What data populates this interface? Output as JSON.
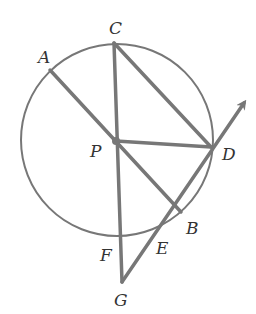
{
  "diagram": {
    "type": "circle-geometry",
    "stroke_color": "#777777",
    "label_color": "#333333",
    "circle": {
      "center": "P",
      "cx": 117,
      "cy": 140,
      "r": 96
    },
    "points": {
      "A": {
        "label": "A",
        "x": 50,
        "y": 70,
        "lx": 38,
        "ly": 63
      },
      "C": {
        "label": "C",
        "x": 114,
        "y": 43,
        "lx": 109,
        "ly": 34
      },
      "P": {
        "label": "P",
        "x": 116,
        "y": 141,
        "lx": 90,
        "ly": 157
      },
      "D": {
        "label": "D",
        "x": 211,
        "y": 147,
        "lx": 222,
        "ly": 160
      },
      "B": {
        "label": "B",
        "x": 181,
        "y": 212,
        "lx": 186,
        "ly": 234
      },
      "E": {
        "label": "E",
        "x": 156,
        "y": 233,
        "lx": 156,
        "ly": 254
      },
      "F": {
        "label": "F",
        "x": 119,
        "y": 238,
        "lx": 100,
        "ly": 261
      },
      "G": {
        "label": "G",
        "x": 122,
        "y": 282,
        "lx": 114,
        "ly": 306
      }
    },
    "segments": [
      {
        "name": "segment-AB",
        "from": "A",
        "to": "B"
      },
      {
        "name": "segment-CG",
        "from": "C",
        "to": "G"
      },
      {
        "name": "segment-CD",
        "from": "C",
        "to": "D"
      },
      {
        "name": "segment-PD",
        "from": "P",
        "to": "D"
      }
    ],
    "ray": {
      "name": "ray-GD",
      "from": "G",
      "through": "D",
      "tip": {
        "x": 244,
        "y": 103
      }
    }
  }
}
